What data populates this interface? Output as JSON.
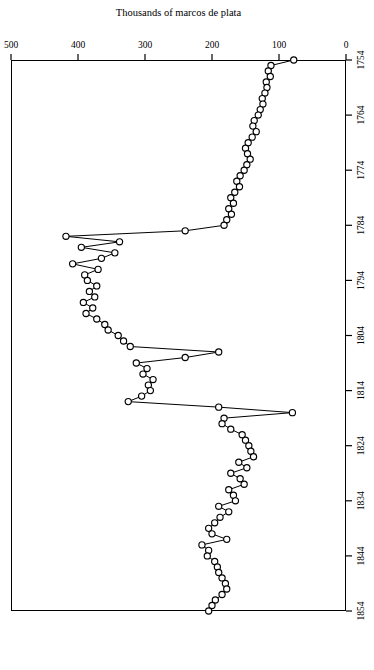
{
  "figure": {
    "background_color": "#ffffff",
    "ink_color": "#000000",
    "orientation": "rotated-180",
    "marker": "open-circle"
  },
  "chart_data": {
    "type": "line",
    "title": "",
    "subtitle": "",
    "xlabel": "",
    "ylabel": "Thousands of marcos de plata",
    "xlim": [
      1754,
      1854
    ],
    "ylim": [
      0,
      500
    ],
    "xticks": [
      1754,
      1764,
      1774,
      1784,
      1794,
      1804,
      1814,
      1824,
      1834,
      1844,
      1854
    ],
    "yticks": [
      0,
      100,
      200,
      300,
      400,
      500
    ],
    "xtick_labels": [
      "1754",
      "1764",
      "1774",
      "1784",
      "1794",
      "1804",
      "1814",
      "1824",
      "1834",
      "1844",
      "1854"
    ],
    "ytick_labels": [
      "0",
      "100",
      "200",
      "300",
      "400",
      "500"
    ],
    "grid": false,
    "legend": null,
    "legend_position": "none",
    "markers": true,
    "marker_style": "open circle",
    "line_width": 1,
    "x": [
      1754,
      1755,
      1756,
      1757,
      1758,
      1759,
      1760,
      1761,
      1762,
      1763,
      1764,
      1765,
      1766,
      1767,
      1768,
      1769,
      1770,
      1771,
      1772,
      1773,
      1774,
      1775,
      1776,
      1777,
      1778,
      1779,
      1780,
      1781,
      1782,
      1783,
      1784,
      1785,
      1786,
      1787,
      1788,
      1789,
      1790,
      1791,
      1792,
      1793,
      1794,
      1795,
      1796,
      1797,
      1798,
      1799,
      1800,
      1801,
      1802,
      1803,
      1804,
      1805,
      1806,
      1807,
      1808,
      1809,
      1810,
      1811,
      1812,
      1813,
      1814,
      1815,
      1816,
      1817,
      1818,
      1819,
      1820,
      1821,
      1822,
      1823,
      1824,
      1825,
      1826,
      1827,
      1828,
      1829,
      1830,
      1831,
      1832,
      1833,
      1834,
      1835,
      1836,
      1837,
      1838,
      1839,
      1840,
      1841,
      1842,
      1843,
      1844,
      1845,
      1846,
      1847,
      1848,
      1849,
      1850,
      1851,
      1852,
      1853,
      1854
    ],
    "y": [
      78,
      112,
      116,
      113,
      119,
      118,
      121,
      125,
      124,
      128,
      131,
      137,
      139,
      134,
      140,
      146,
      150,
      147,
      143,
      148,
      152,
      158,
      163,
      159,
      166,
      172,
      168,
      175,
      171,
      178,
      182,
      240,
      418,
      338,
      395,
      345,
      365,
      408,
      370,
      390,
      386,
      372,
      383,
      375,
      392,
      378,
      388,
      372,
      360,
      355,
      340,
      332,
      322,
      190,
      240,
      313,
      297,
      303,
      288,
      295,
      292,
      305,
      325,
      190,
      80,
      182,
      185,
      172,
      155,
      150,
      145,
      142,
      138,
      160,
      148,
      172,
      158,
      152,
      175,
      168,
      165,
      190,
      175,
      188,
      196,
      205,
      200,
      178,
      215,
      205,
      207,
      196,
      192,
      190,
      185,
      180,
      178,
      185,
      195,
      200,
      205
    ]
  },
  "axis": {
    "y_title": "Thousands of marcos de plata",
    "x_origin_label": "1754"
  }
}
